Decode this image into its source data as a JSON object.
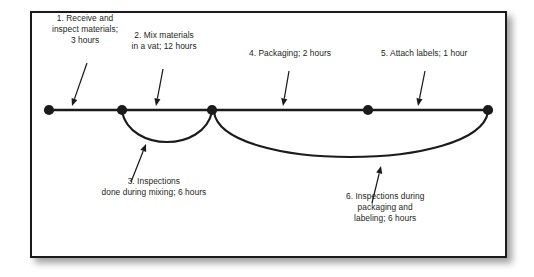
{
  "figure": {
    "background_color": "#ffffff",
    "border_color": "#1b1b1b",
    "line_color": "#1b1b1b",
    "text_color": "#231f20"
  },
  "timeline": {
    "axis_y": 110,
    "start_x": 49,
    "end_x": 488,
    "nodes": [
      {
        "id": "node-1",
        "x": 49,
        "y": 110
      },
      {
        "id": "node-2",
        "x": 122,
        "y": 110
      },
      {
        "id": "node-3",
        "x": 212,
        "y": 110
      },
      {
        "id": "node-4",
        "x": 368,
        "y": 110
      },
      {
        "id": "node-5",
        "x": 488,
        "y": 110
      }
    ]
  },
  "steps": [
    {
      "number": "1",
      "label": "1. Receive and\ninspect materials;\n3 hours",
      "task": "Receive and inspect materials",
      "duration": "3 hours",
      "label_x": 85,
      "label_y": 30,
      "arrow": {
        "x1": 87,
        "y1": 63,
        "x2": 72,
        "y2": 106
      }
    },
    {
      "number": "2",
      "label": "2. Mix materials\nin a vat; 12 hours",
      "task": "Mix materials in a vat",
      "duration": "12 hours",
      "label_x": 164,
      "label_y": 41,
      "arrow": {
        "x1": 163,
        "y1": 69,
        "x2": 156,
        "y2": 106
      }
    },
    {
      "number": "3",
      "label": "3. Inspections\ndone during mixing; 6 hours",
      "task": "Inspections done during mixing",
      "duration": "6 hours",
      "label_x": 154,
      "label_y": 187,
      "arrow": {
        "x1": 131,
        "y1": 182,
        "x2": 146,
        "y2": 144
      }
    },
    {
      "number": "4",
      "label": "4. Packaging; 2 hours",
      "task": "Packaging",
      "duration": "2 hours",
      "label_x": 290,
      "label_y": 53,
      "arrow": {
        "x1": 289,
        "y1": 71,
        "x2": 283,
        "y2": 106
      }
    },
    {
      "number": "5",
      "label": "5. Attach labels; 1 hour",
      "task": "Attach labels",
      "duration": "1 hour",
      "label_x": 424,
      "label_y": 53,
      "arrow": {
        "x1": 425,
        "y1": 71,
        "x2": 418,
        "y2": 106
      }
    },
    {
      "number": "6",
      "label": "6. Inspections during\npackaging and\nlabeling; 6 hours",
      "task": "Inspections during packaging and labeling",
      "duration": "6 hours",
      "label_x": 385,
      "label_y": 208,
      "arrow": {
        "x1": 372,
        "y1": 203,
        "x2": 381,
        "y2": 166
      }
    }
  ],
  "arcs": [
    {
      "id": "arc-inspections-mixing",
      "from_node": "node-2",
      "to_node": "node-3",
      "path": "M 122 112 C 131 152, 203 152, 212 112"
    },
    {
      "id": "arc-inspections-packaging",
      "from_node": "node-3",
      "to_node": "node-5",
      "path": "M 214 112 C 222 172, 478 172, 488 112"
    }
  ]
}
